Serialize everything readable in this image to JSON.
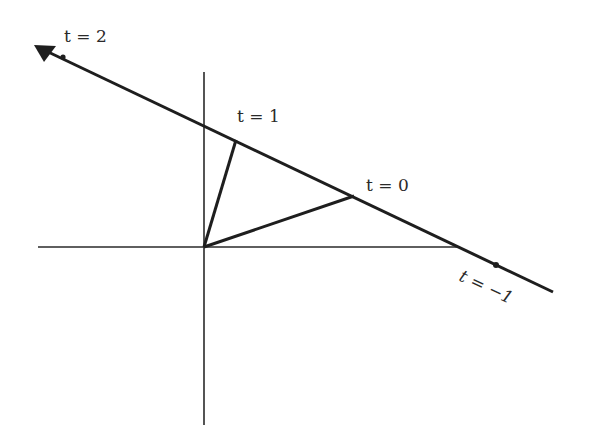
{
  "diagram": {
    "colors": {
      "background": "#ffffff",
      "line": "#1e1e1e",
      "axis": "#2a2a2a",
      "text": "#2a2a2a"
    },
    "labels": {
      "t2": "t = 2",
      "t1": "t = 1",
      "t0": "t = 0",
      "tneg1": "t = −1"
    },
    "points": [
      {
        "name": "t=2",
        "t": 2
      },
      {
        "name": "t=1",
        "t": 1
      },
      {
        "name": "t=0",
        "t": 0
      },
      {
        "name": "t=-1",
        "t": -1
      }
    ],
    "elements": {
      "x_axis": "horizontal axis",
      "y_axis": "vertical axis",
      "main_line": "line with arrowhead pointing toward increasing t",
      "vectors": [
        "origin to t=1 point",
        "origin to t=0 point"
      ]
    }
  }
}
